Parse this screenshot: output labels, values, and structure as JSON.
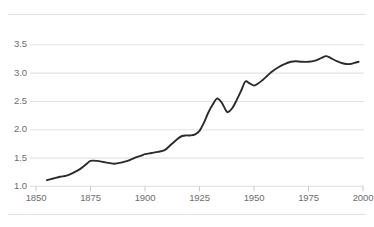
{
  "figure": {
    "name": "line-chart-figure",
    "top_rule": true,
    "bottom_rule": true,
    "background_color": "#ffffff",
    "rule_color": "#e4e4e4",
    "gridline_color": "#e3e3e3",
    "line_color": "#2b2b2b",
    "tick_color": "#c9c9c9",
    "label_color": "#6d6d6d"
  },
  "chart_data": {
    "type": "line",
    "title": "",
    "subtitle": "",
    "xlabel": "",
    "ylabel": "",
    "xlim": [
      1850,
      2000
    ],
    "ylim": [
      1.0,
      3.5
    ],
    "xticks": [
      1850,
      1875,
      1900,
      1925,
      1950,
      1975,
      2000
    ],
    "xtick_labels": [
      "1850",
      "1875",
      "1900",
      "1925",
      "1950",
      "1975",
      "2000"
    ],
    "yticks": [
      1.0,
      1.5,
      2.0,
      2.5,
      3.0,
      3.5
    ],
    "ytick_labels": [
      "1.0",
      "1.5",
      "2.0",
      "2.5",
      "3.0",
      "3.5"
    ],
    "grid": "horizontal",
    "legend": "none",
    "annotations": [],
    "series": [
      {
        "name": "series-1",
        "color": "#2b2b2b",
        "x": [
          1855,
          1858,
          1861,
          1864,
          1867,
          1870,
          1873,
          1875,
          1878,
          1881,
          1884,
          1886,
          1889,
          1892,
          1895,
          1898,
          1900,
          1903,
          1906,
          1909,
          1912,
          1915,
          1917,
          1919,
          1921,
          1923,
          1925,
          1927,
          1929,
          1931,
          1933,
          1935,
          1937,
          1938,
          1940,
          1942,
          1944,
          1946,
          1948,
          1950,
          1952,
          1954,
          1956,
          1958,
          1961,
          1964,
          1967,
          1969,
          1972,
          1975,
          1978,
          1981,
          1983,
          1985,
          1988,
          1991,
          1994,
          1996,
          1998
        ],
        "y": [
          1.11,
          1.14,
          1.17,
          1.19,
          1.24,
          1.3,
          1.39,
          1.45,
          1.45,
          1.43,
          1.41,
          1.4,
          1.42,
          1.45,
          1.5,
          1.54,
          1.57,
          1.59,
          1.61,
          1.64,
          1.74,
          1.84,
          1.89,
          1.9,
          1.9,
          1.92,
          1.98,
          2.12,
          2.3,
          2.44,
          2.55,
          2.49,
          2.35,
          2.31,
          2.38,
          2.52,
          2.68,
          2.85,
          2.82,
          2.78,
          2.82,
          2.88,
          2.95,
          3.02,
          3.1,
          3.16,
          3.2,
          3.21,
          3.2,
          3.2,
          3.22,
          3.27,
          3.3,
          3.27,
          3.21,
          3.17,
          3.16,
          3.18,
          3.2
        ]
      }
    ]
  }
}
